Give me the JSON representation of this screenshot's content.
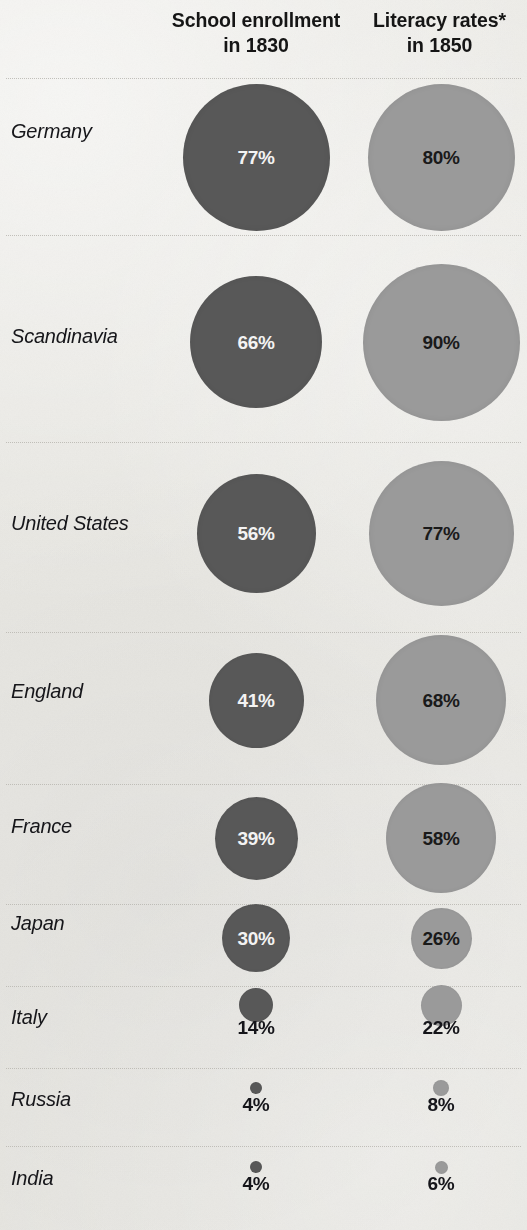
{
  "header": {
    "enrollment": {
      "line1": "School enrollment",
      "line2": "in 1830"
    },
    "literacy": {
      "line1": "Literacy rates*",
      "line2": "in 1850"
    }
  },
  "colors": {
    "background": "#e9e8e4",
    "enrollment_bubble": "#585858",
    "literacy_bubble": "#9a9a9a",
    "enrollment_label": "#f3f3f3",
    "literacy_label": "#1a1a1a",
    "separator": "#b9b7b1"
  },
  "rows": [
    {
      "country": "Germany",
      "enrollment": "77%",
      "literacy": "80%"
    },
    {
      "country": "Scandinavia",
      "enrollment": "66%",
      "literacy": "90%"
    },
    {
      "country": "United States",
      "enrollment": "56%",
      "literacy": "77%"
    },
    {
      "country": "England",
      "enrollment": "41%",
      "literacy": "68%"
    },
    {
      "country": "France",
      "enrollment": "39%",
      "literacy": "58%"
    },
    {
      "country": "Japan",
      "enrollment": "30%",
      "literacy": "26%"
    },
    {
      "country": "Italy",
      "enrollment": "14%",
      "literacy": "22%"
    },
    {
      "country": "Russia",
      "enrollment": "4%",
      "literacy": "8%"
    },
    {
      "country": "India",
      "enrollment": "4%",
      "literacy": "6%"
    }
  ],
  "chart_data": {
    "type": "bubble",
    "title": "",
    "xlabel": "",
    "ylabel": "",
    "grid": false,
    "legend_position": "top",
    "note": "Bubble area scales with the percentage; values shown inside large bubbles and below small bubbles.",
    "categories": [
      "Germany",
      "Scandinavia",
      "United States",
      "England",
      "France",
      "Japan",
      "Italy",
      "Russia",
      "India"
    ],
    "series": [
      {
        "name": "School enrollment in 1830",
        "color": "#585858",
        "unit": "%",
        "values": [
          77,
          66,
          56,
          41,
          39,
          30,
          14,
          4,
          4
        ]
      },
      {
        "name": "Literacy rates* in 1850",
        "color": "#9a9a9a",
        "unit": "%",
        "values": [
          80,
          90,
          77,
          68,
          58,
          26,
          22,
          8,
          6
        ]
      }
    ],
    "footnote_marker": "*"
  },
  "layout": {
    "enrollment_center_x": 256,
    "literacy_center_x": 441,
    "rows": [
      {
        "top": 78,
        "height": 157,
        "label_y": 133,
        "cy": 157,
        "d_enroll": 147,
        "d_lit": 147,
        "inside": true
      },
      {
        "top": 235,
        "height": 207,
        "label_y": 338,
        "cy": 342,
        "d_enroll": 132,
        "d_lit": 157,
        "inside": true
      },
      {
        "top": 442,
        "height": 190,
        "label_y": 525,
        "cy": 533,
        "d_enroll": 119,
        "d_lit": 145,
        "inside": true
      },
      {
        "top": 632,
        "height": 152,
        "label_y": 693,
        "cy": 700,
        "d_enroll": 95,
        "d_lit": 130,
        "inside": true
      },
      {
        "top": 784,
        "height": 120,
        "label_y": 828,
        "cy": 838,
        "d_enroll": 83,
        "d_lit": 110,
        "inside": true
      },
      {
        "top": 904,
        "height": 82,
        "label_y": 925,
        "cy": 938,
        "d_enroll": 68,
        "d_lit": 61,
        "inside": true
      },
      {
        "top": 986,
        "height": 82,
        "label_y": 1019,
        "cy": 1005,
        "d_enroll": 34,
        "d_lit": 41,
        "inside": false,
        "val_y": 1030
      },
      {
        "top": 1068,
        "height": 78,
        "label_y": 1101,
        "cy": 1088,
        "d_enroll": 12,
        "d_lit": 16,
        "inside": false,
        "val_y": 1107
      },
      {
        "top": 1146,
        "height": 78,
        "label_y": 1180,
        "cy": 1167,
        "d_enroll": 12,
        "d_lit": 13,
        "inside": false,
        "val_y": 1186
      }
    ]
  }
}
